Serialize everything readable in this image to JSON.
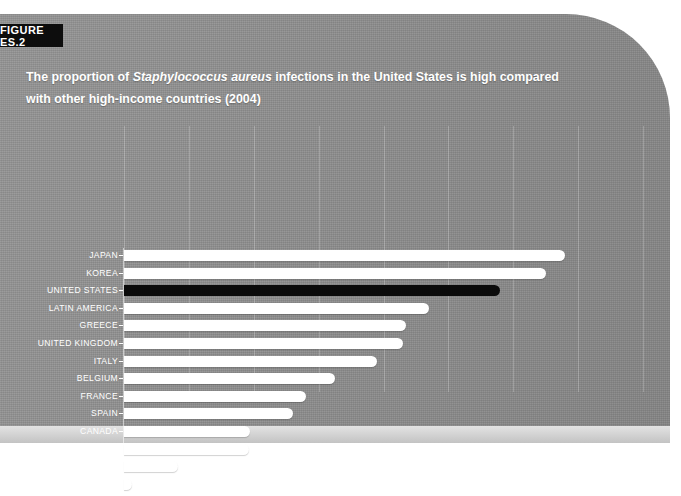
{
  "figure": {
    "tab_label": "FIGURE ES.2",
    "title_part1": "The proportion of ",
    "title_species": "Staphylococcus aureus",
    "title_part2": " infections in the United States is high compared with other high-income countries (2004)"
  },
  "colors": {
    "panel_background": "#8d8d8d",
    "bar": "#ffffff",
    "bar_highlight": "#0b0b0b",
    "text": "#ffffff",
    "tab_background": "#0d0d0d",
    "below_strip": "#cfcfcf"
  },
  "chart_data": {
    "type": "bar",
    "orientation": "horizontal",
    "title": "The proportion of Staphylococcus aureus infections in the United States is high compared with other high-income countries (2004)",
    "xlabel": "",
    "ylabel": "",
    "xlim": [
      0,
      80
    ],
    "xticks": [
      0,
      10,
      20,
      30,
      40,
      50,
      60,
      70,
      80
    ],
    "xtick_labels": [
      "0%",
      "10%",
      "20%",
      "30%",
      "40%",
      "50%",
      "60%",
      "70%",
      "80%"
    ],
    "grid": true,
    "legend": "none",
    "highlight_category": "UNITED STATES",
    "categories": [
      "JAPAN",
      "KOREA",
      "UNITED STATES",
      "LATIN AMERICA",
      "GREECE",
      "UNITED KINGDOM",
      "ITALY",
      "BELGIUM",
      "FRANCE",
      "SPAIN",
      "CANADA",
      "GERMANY",
      "CZECH REPUBLIC",
      "THE NETHERLANDS"
    ],
    "values": [
      68,
      65,
      58,
      47,
      43.5,
      43,
      39,
      32.5,
      28,
      26,
      19.4,
      19.3,
      8.3,
      1.2
    ],
    "series": [
      {
        "name": "Proportion of Staphylococcus aureus infections that are MRSA",
        "values": [
          68,
          65,
          58,
          47,
          43.5,
          43,
          39,
          32.5,
          28,
          26,
          19.4,
          19.3,
          8.3,
          1.2
        ]
      }
    ]
  }
}
